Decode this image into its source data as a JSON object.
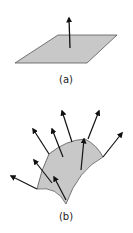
{
  "figure": {
    "panels": [
      {
        "id": "a",
        "caption": "(a)",
        "description": "Flat plane with a single normal vector",
        "surface_color": "#c8c8c8",
        "edge_color": "#555555"
      },
      {
        "id": "b",
        "caption": "(b)",
        "description": "Curved surface with normal vectors at multiple points",
        "surface_color": "#c8c8c8",
        "edge_color": "#555555",
        "normal_count": 9
      }
    ],
    "arrow_color": "#111111"
  }
}
